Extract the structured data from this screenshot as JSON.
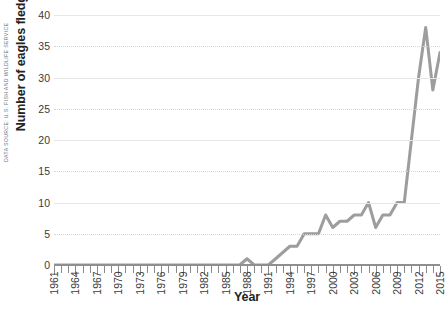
{
  "chart_data": {
    "type": "line",
    "title": "",
    "xlabel": "Year",
    "ylabel": "Number of eagles fledged",
    "source_note": "DATA SOURCE: U.S. FISH AND WILDLIFE SERVICE",
    "xlim": [
      1961,
      2015
    ],
    "ylim": [
      0,
      40
    ],
    "ytick_values": [
      0,
      5,
      10,
      15,
      20,
      25,
      30,
      35,
      40
    ],
    "ytick_labels": [
      "0",
      "5",
      "10",
      "15",
      "20",
      "25",
      "30",
      "35",
      "40"
    ],
    "xtick_labels": [
      "1961",
      "1964",
      "1967",
      "1970",
      "1973",
      "1976",
      "1979",
      "1982",
      "1985",
      "1988",
      "1991",
      "1994",
      "1997",
      "2000",
      "2003",
      "2006",
      "2009",
      "2012",
      "2015"
    ],
    "xtick_step": 3,
    "grid": true,
    "legend": "none",
    "line_color": "#9d9d9d",
    "axis_color": "#8a8a8a",
    "grid_color": "#d6d6d6",
    "text_color": "#232323",
    "x": [
      1961,
      1962,
      1963,
      1964,
      1965,
      1966,
      1967,
      1968,
      1969,
      1970,
      1971,
      1972,
      1973,
      1974,
      1975,
      1976,
      1977,
      1978,
      1979,
      1980,
      1981,
      1982,
      1983,
      1984,
      1985,
      1986,
      1987,
      1988,
      1989,
      1990,
      1991,
      1992,
      1993,
      1994,
      1995,
      1996,
      1997,
      1998,
      1999,
      2000,
      2001,
      2002,
      2003,
      2004,
      2005,
      2006,
      2007,
      2008,
      2009,
      2010,
      2011,
      2012,
      2013,
      2014,
      2015
    ],
    "values": [
      0,
      0,
      0,
      0,
      0,
      0,
      0,
      0,
      0,
      0,
      0,
      0,
      0,
      0,
      0,
      0,
      0,
      0,
      0,
      0,
      0,
      0,
      0,
      0,
      0,
      0,
      0,
      1,
      0,
      0,
      0,
      1,
      2,
      3,
      3,
      5,
      5,
      5,
      8,
      6,
      7,
      7,
      8,
      8,
      10,
      6,
      8,
      8,
      10,
      10,
      20,
      30,
      38,
      28,
      34
    ]
  }
}
